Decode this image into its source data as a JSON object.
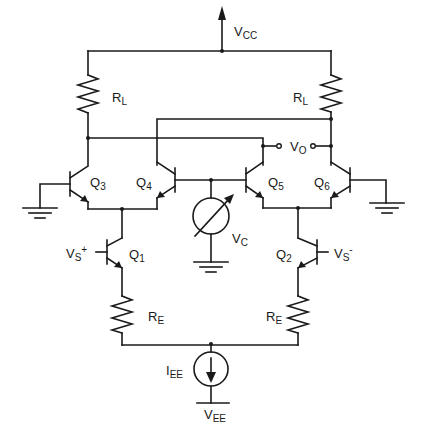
{
  "diagram": {
    "colors": {
      "wire": "#1a1a1a",
      "background": "#ffffff"
    },
    "labels": {
      "vcc": {
        "main": "V",
        "sub": "CC"
      },
      "rl_left": {
        "main": "R",
        "sub": "L"
      },
      "rl_right": {
        "main": "R",
        "sub": "L"
      },
      "vo": {
        "main": "V",
        "sub": "O"
      },
      "q3": {
        "main": "Q",
        "sub": "3"
      },
      "q4": {
        "main": "Q",
        "sub": "4"
      },
      "q5": {
        "main": "Q",
        "sub": "5"
      },
      "q6": {
        "main": "Q",
        "sub": "6"
      },
      "vc": {
        "main": "V",
        "sub": "C"
      },
      "vs_plus": {
        "main": "V",
        "sub": "S",
        "sup": "+"
      },
      "vs_minus": {
        "main": "V",
        "sub": "S",
        "sup": "-"
      },
      "q1": {
        "main": "Q",
        "sub": "1"
      },
      "q2": {
        "main": "Q",
        "sub": "2"
      },
      "re_left": {
        "main": "R",
        "sub": "E"
      },
      "re_right": {
        "main": "R",
        "sub": "E"
      },
      "iee": {
        "main": "I",
        "sub": "EE"
      },
      "vee": {
        "main": "V",
        "sub": "EE"
      }
    },
    "components": [
      {
        "id": "RL1",
        "type": "resistor",
        "label": "RL"
      },
      {
        "id": "RL2",
        "type": "resistor",
        "label": "RL"
      },
      {
        "id": "Q1",
        "type": "npn"
      },
      {
        "id": "Q2",
        "type": "npn"
      },
      {
        "id": "Q3",
        "type": "npn"
      },
      {
        "id": "Q4",
        "type": "npn"
      },
      {
        "id": "Q5",
        "type": "npn"
      },
      {
        "id": "Q6",
        "type": "npn"
      },
      {
        "id": "VC",
        "type": "variable-voltage-source"
      },
      {
        "id": "RE1",
        "type": "resistor",
        "label": "RE"
      },
      {
        "id": "RE2",
        "type": "resistor",
        "label": "RE"
      },
      {
        "id": "IEE",
        "type": "current-source"
      }
    ]
  }
}
